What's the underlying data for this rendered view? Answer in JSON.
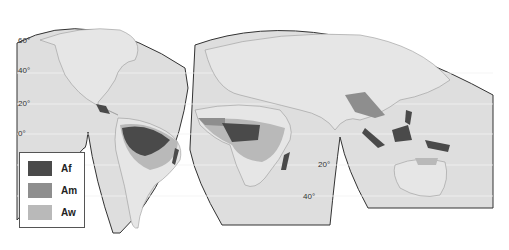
{
  "map": {
    "title": "",
    "colors": {
      "Af": "#4a4a4a",
      "Am": "#8e8e8e",
      "Aw": "#b9b9b9",
      "land": "#e3e3e3",
      "ocean": "#dcdcdc",
      "border": "#333333"
    },
    "latitude_labels": [
      {
        "label": "60°",
        "x": 18,
        "y": 40
      },
      {
        "label": "40°",
        "x": 18,
        "y": 70
      },
      {
        "label": "20°",
        "x": 18,
        "y": 103
      },
      {
        "label": "0°",
        "x": 18,
        "y": 133
      },
      {
        "label": "20°",
        "x": 318,
        "y": 165
      },
      {
        "label": "40°",
        "x": 303,
        "y": 196
      }
    ],
    "legend": [
      {
        "code": "Af",
        "label": "Af"
      },
      {
        "code": "Am",
        "label": "Am"
      },
      {
        "code": "Aw",
        "label": "Aw"
      }
    ]
  }
}
